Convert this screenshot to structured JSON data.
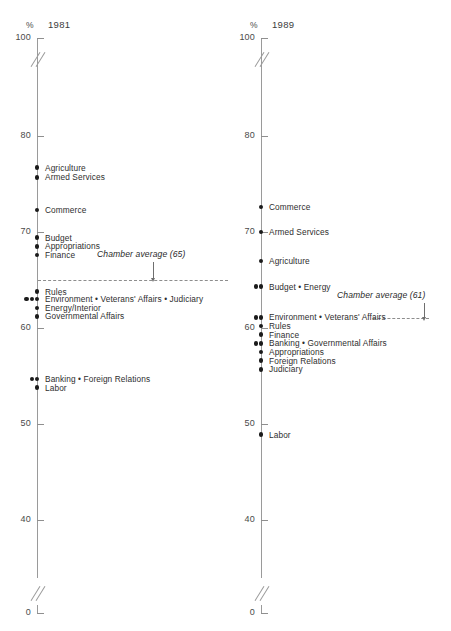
{
  "figure": {
    "panels": [
      {
        "id": "1981",
        "year_label": "1981",
        "percent_symbol": "%",
        "axis": {
          "ticks": [
            "100",
            "80",
            "70",
            "60",
            "50",
            "40",
            "0"
          ],
          "break_symbol": "axis-break"
        },
        "chamber_average": {
          "note": "Chamber average (65)",
          "value": 65
        },
        "points": [
          {
            "label": "Agriculture",
            "value": 76.7,
            "dots": 1
          },
          {
            "label": "Armed Services",
            "value": 75.7,
            "dots": 1
          },
          {
            "label": "Commerce",
            "value": 72.3,
            "dots": 1
          },
          {
            "label": "Budget",
            "value": 69.4,
            "dots": 1
          },
          {
            "label": "Appropriations",
            "value": 68.5,
            "dots": 1
          },
          {
            "label": "Finance",
            "value": 67.6,
            "dots": 1
          },
          {
            "label": "Rules",
            "value": 63.8,
            "dots": 1
          },
          {
            "label": "Environment • Veterans' Affairs • Judiciary",
            "value": 63.0,
            "dots": 3
          },
          {
            "label": "Energy/Interior",
            "value": 62.1,
            "dots": 1
          },
          {
            "label": "Governmental Affairs",
            "value": 61.2,
            "dots": 1
          },
          {
            "label": "Banking • Foreign Relations",
            "value": 54.7,
            "dots": 2
          },
          {
            "label": "Labor",
            "value": 53.8,
            "dots": 1
          }
        ]
      },
      {
        "id": "1989",
        "year_label": "1989",
        "percent_symbol": "%",
        "axis": {
          "ticks": [
            "100",
            "80",
            "70",
            "60",
            "50",
            "40",
            "0"
          ],
          "break_symbol": "axis-break"
        },
        "chamber_average": {
          "note": "Chamber average (61)",
          "value": 61
        },
        "points": [
          {
            "label": "Commerce",
            "value": 72.6,
            "dots": 1
          },
          {
            "label": "Armed Services",
            "value": 70.0,
            "dots": 1
          },
          {
            "label": "Agriculture",
            "value": 67.0,
            "dots": 1
          },
          {
            "label": "Budget • Energy",
            "value": 64.3,
            "dots": 2
          },
          {
            "label": "Environment • Veterans' Affairs",
            "value": 61.1,
            "dots": 2
          },
          {
            "label": "Rules",
            "value": 60.2,
            "dots": 1
          },
          {
            "label": "Finance",
            "value": 59.3,
            "dots": 1
          },
          {
            "label": "Banking • Governmental Affairs",
            "value": 58.4,
            "dots": 2
          },
          {
            "label": "Appropriations",
            "value": 57.5,
            "dots": 1
          },
          {
            "label": "Foreign Relations",
            "value": 56.6,
            "dots": 1
          },
          {
            "label": "Judiciary",
            "value": 55.7,
            "dots": 1
          },
          {
            "label": "Labor",
            "value": 48.9,
            "dots": 1
          }
        ]
      }
    ]
  },
  "chart_data": {
    "type": "scatter",
    "title": "",
    "subtitle": "",
    "xlabel": "",
    "ylabel": "%",
    "ylim": [
      0,
      100
    ],
    "yticks": [
      0,
      40,
      50,
      60,
      70,
      80,
      100
    ],
    "axis_break": "between 0 and 40 (and between 80 and 100)",
    "grid": false,
    "legend": "none",
    "categories": [
      "1981",
      "1989"
    ],
    "annotations": [
      "Chamber average (65)",
      "Chamber average (61)"
    ],
    "series": [
      {
        "name": "1981",
        "points": [
          {
            "committee": "Agriculture",
            "value": 76.7
          },
          {
            "committee": "Armed Services",
            "value": 75.7
          },
          {
            "committee": "Commerce",
            "value": 72.3
          },
          {
            "committee": "Budget",
            "value": 69.4
          },
          {
            "committee": "Appropriations",
            "value": 68.5
          },
          {
            "committee": "Finance",
            "value": 67.6
          },
          {
            "committee": "Rules",
            "value": 63.8
          },
          {
            "committee": "Environment",
            "value": 63.0
          },
          {
            "committee": "Veterans' Affairs",
            "value": 63.0
          },
          {
            "committee": "Judiciary",
            "value": 63.0
          },
          {
            "committee": "Energy/Interior",
            "value": 62.1
          },
          {
            "committee": "Governmental Affairs",
            "value": 61.2
          },
          {
            "committee": "Banking",
            "value": 54.7
          },
          {
            "committee": "Foreign Relations",
            "value": 54.7
          },
          {
            "committee": "Labor",
            "value": 53.8
          }
        ],
        "chamber_average": 65
      },
      {
        "name": "1989",
        "points": [
          {
            "committee": "Commerce",
            "value": 72.6
          },
          {
            "committee": "Armed Services",
            "value": 70.0
          },
          {
            "committee": "Agriculture",
            "value": 67.0
          },
          {
            "committee": "Budget",
            "value": 64.3
          },
          {
            "committee": "Energy",
            "value": 64.3
          },
          {
            "committee": "Environment",
            "value": 61.1
          },
          {
            "committee": "Veterans' Affairs",
            "value": 61.1
          },
          {
            "committee": "Rules",
            "value": 60.2
          },
          {
            "committee": "Finance",
            "value": 59.3
          },
          {
            "committee": "Banking",
            "value": 58.4
          },
          {
            "committee": "Governmental Affairs",
            "value": 58.4
          },
          {
            "committee": "Appropriations",
            "value": 57.5
          },
          {
            "committee": "Foreign Relations",
            "value": 56.6
          },
          {
            "committee": "Judiciary",
            "value": 55.7
          },
          {
            "committee": "Labor",
            "value": 48.9
          }
        ],
        "chamber_average": 61
      }
    ]
  },
  "colors": {
    "dot": "#1b1b1b",
    "axis": "#9a9a9a",
    "text": "#2e2e2e",
    "background": "#ffffff"
  }
}
